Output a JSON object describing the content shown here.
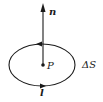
{
  "diagram": {
    "normal_vector_label": "n",
    "point_label": "P",
    "area_label": "ΔS",
    "loop_label": "l",
    "colors": {
      "stroke": "#1a1a1a",
      "background": "#ffffff"
    }
  }
}
